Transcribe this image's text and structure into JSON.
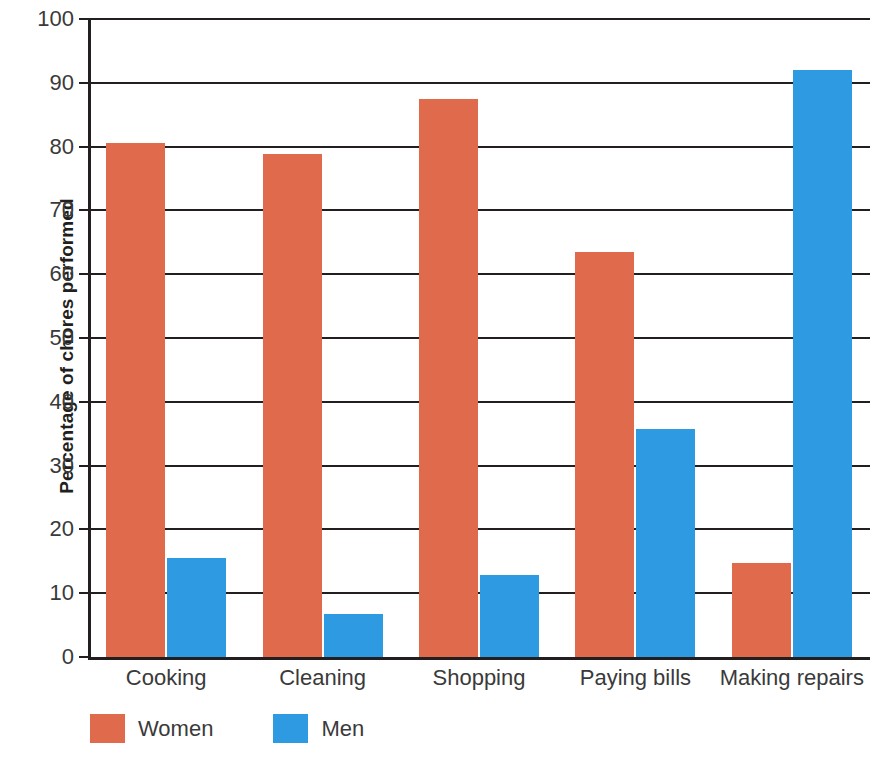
{
  "chart_data": {
    "type": "bar",
    "title": "",
    "xlabel": "",
    "ylabel": "Percentage of chores performed",
    "ylim": [
      0,
      100
    ],
    "ytick_step": 10,
    "yticks": [
      0,
      10,
      20,
      30,
      40,
      50,
      60,
      70,
      80,
      90,
      100
    ],
    "grid": true,
    "legend_position": "bottom-left",
    "categories": [
      "Cooking",
      "Cleaning",
      "Shopping",
      "Paying bills",
      "Making repairs"
    ],
    "series": [
      {
        "name": "Women",
        "color": "#df6a4c",
        "values": [
          80.5,
          78.8,
          87.5,
          63.5,
          14.8
        ]
      },
      {
        "name": "Men",
        "color": "#2e9ae1",
        "values": [
          15.5,
          6.8,
          12.8,
          35.7,
          92.0
        ]
      }
    ]
  },
  "axis": {
    "y_title": "Percentage of chores performed",
    "tick_labels": [
      "0",
      "10",
      "20",
      "30",
      "40",
      "50",
      "60",
      "70",
      "80",
      "90",
      "100"
    ]
  },
  "legend": {
    "items": [
      {
        "label": "Women",
        "color": "#df6a4c"
      },
      {
        "label": "Men",
        "color": "#2e9ae1"
      }
    ]
  }
}
